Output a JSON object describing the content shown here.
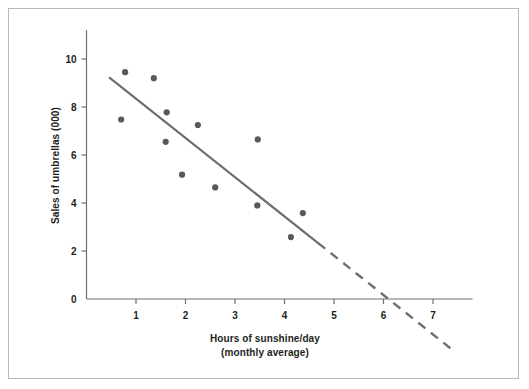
{
  "figure": {
    "background": "#ffffff",
    "border_color": "#b9b9bd",
    "axis_color": "#6d6e71",
    "point_color": "#58595b",
    "line_color": "#6d6e71"
  },
  "chart_data": {
    "type": "scatter",
    "title": "",
    "xlabel_line1": "Hours of sunshine/day",
    "xlabel_line2": "(monthly average)",
    "ylabel": "Sales of umbrellas (000)",
    "xlim": [
      0,
      7.8
    ],
    "ylim": [
      0,
      11.2
    ],
    "xticks": [
      1,
      2,
      3,
      4,
      5,
      6,
      7
    ],
    "xticklabels": [
      "1",
      "2",
      "3",
      "4",
      "5",
      "6",
      "7"
    ],
    "yticks": [
      0,
      2,
      4,
      6,
      8,
      10
    ],
    "yticklabels": [
      "0",
      "2",
      "4",
      "6",
      "8",
      "10"
    ],
    "grid": false,
    "legend": null,
    "points": [
      {
        "x": 0.78,
        "y": 9.45
      },
      {
        "x": 0.7,
        "y": 7.48
      },
      {
        "x": 1.36,
        "y": 9.2
      },
      {
        "x": 1.62,
        "y": 7.78
      },
      {
        "x": 1.6,
        "y": 6.55
      },
      {
        "x": 1.93,
        "y": 5.18
      },
      {
        "x": 2.25,
        "y": 7.25
      },
      {
        "x": 2.6,
        "y": 4.65
      },
      {
        "x": 3.46,
        "y": 6.65
      },
      {
        "x": 3.45,
        "y": 3.9
      },
      {
        "x": 4.13,
        "y": 2.58
      },
      {
        "x": 4.37,
        "y": 3.58
      }
    ],
    "trend_line": {
      "style": "solid-then-dashed",
      "solid_segment": {
        "x1": 0.47,
        "y1": 9.21,
        "x2": 4.68,
        "y2": 2.33
      },
      "dashed_segment": {
        "x1": 4.68,
        "y1": 2.33,
        "x2": 7.35,
        "y2": -2.05
      },
      "x_intercept": 6.2
    }
  }
}
